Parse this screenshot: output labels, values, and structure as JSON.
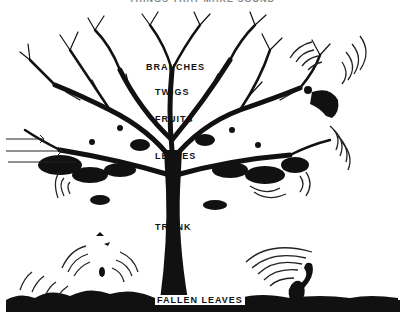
{
  "diagram": {
    "caption": "THINGS THAT MAKE SOUND",
    "labels": {
      "branches": "BRANCHES",
      "twigs": "TWIGS",
      "fruits": "FRUITS",
      "leaves": "LEAVES",
      "trunk": "TRUNK",
      "fallen_leaves": "FALLEN LEAVES"
    },
    "elements": [
      "tree",
      "wind-arrows",
      "falling-squirrel",
      "ground-squirrel",
      "falling-fruit",
      "sound-waves",
      "ground-litter"
    ],
    "colors": {
      "ink": "#111111",
      "paper": "#ffffff"
    }
  }
}
